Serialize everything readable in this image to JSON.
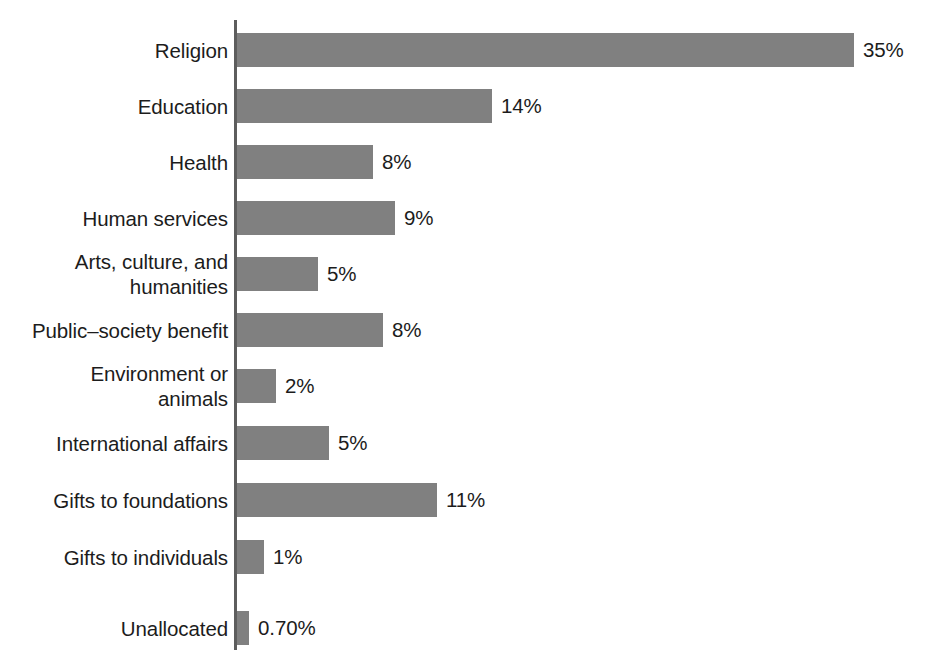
{
  "chart_data": {
    "type": "bar",
    "orientation": "horizontal",
    "title": "",
    "subtitle": "",
    "xlabel": "",
    "ylabel": "",
    "grid": false,
    "legend": null,
    "axis_visible": {
      "category_axis": true,
      "value_axis": false
    },
    "value_format": "percent",
    "categories": [
      "Religion",
      "Education",
      "Health",
      "Human services",
      "Arts, culture, and\nhumanities",
      "Public–society benefit",
      "Environment or\nanimals",
      "International affairs",
      "Gifts to foundations",
      "Gifts to individuals",
      "Unallocated"
    ],
    "values": [
      35,
      14,
      8,
      9,
      5,
      8,
      2,
      5,
      11,
      1,
      0.7
    ],
    "value_labels": [
      "35%",
      "14%",
      "8%",
      "9%",
      "5%",
      "8%",
      "2%",
      "5%",
      "11%",
      "1%",
      "0.70%"
    ],
    "bar_pixel_widths": [
      617,
      255,
      136,
      158,
      81,
      146,
      39,
      92,
      200,
      27,
      12
    ],
    "xlim": [
      0,
      35
    ],
    "colors": {
      "bar": "#808080",
      "axis": "#5d5d5d",
      "text": "#1c1c1c",
      "background": "#ffffff"
    }
  },
  "bars": [
    {
      "label": "Religion",
      "value_label": "35%",
      "width_px": 617,
      "top_px": 33
    },
    {
      "label": "Education",
      "value_label": "14%",
      "width_px": 255,
      "top_px": 89
    },
    {
      "label": "Health",
      "value_label": "8%",
      "width_px": 136,
      "top_px": 145
    },
    {
      "label": "Human services",
      "value_label": "9%",
      "width_px": 158,
      "top_px": 201
    },
    {
      "label": "Arts, culture, and\nhumanities",
      "value_label": "5%",
      "width_px": 81,
      "top_px": 257
    },
    {
      "label": "Public–society benefit",
      "value_label": "8%",
      "width_px": 146,
      "top_px": 313
    },
    {
      "label": "Environment or\nanimals",
      "value_label": "2%",
      "width_px": 39,
      "top_px": 369
    },
    {
      "label": "International affairs",
      "value_label": "5%",
      "width_px": 92,
      "top_px": 426
    },
    {
      "label": "Gifts to foundations",
      "value_label": "11%",
      "width_px": 200,
      "top_px": 483
    },
    {
      "label": "Gifts to individuals",
      "value_label": "1%",
      "width_px": 27,
      "top_px": 540
    },
    {
      "label": "Unallocated",
      "value_label": "0.70%",
      "width_px": 12,
      "top_px": 611
    }
  ]
}
